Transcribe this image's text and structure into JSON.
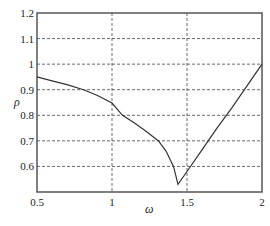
{
  "chart_data": {
    "type": "line",
    "title": "",
    "xlabel": "ω",
    "ylabel": "ρ",
    "xlim": [
      0.5,
      2
    ],
    "ylim": [
      0.5,
      1.2
    ],
    "xticks": [
      "0.5",
      "1",
      "1.5",
      "2"
    ],
    "yticks": [
      "0.6",
      "0.7",
      "0.8",
      "0.9",
      "1",
      "1.1",
      "1.2"
    ],
    "grid": true,
    "legend": null,
    "series": [
      {
        "name": "rho",
        "x": [
          0.5,
          0.6,
          0.7,
          0.81,
          0.9,
          1.0,
          1.07,
          1.15,
          1.22,
          1.31,
          1.36,
          1.41,
          1.44,
          1.5,
          1.6,
          1.7,
          1.8,
          1.9,
          2.0
        ],
        "y": [
          0.95,
          0.935,
          0.92,
          0.9,
          0.878,
          0.848,
          0.8,
          0.77,
          0.74,
          0.7,
          0.66,
          0.6,
          0.53,
          0.58,
          0.665,
          0.75,
          0.83,
          0.915,
          1.0
        ]
      }
    ]
  },
  "axes": {
    "x_label": "ω",
    "y_label": "ρ",
    "x_ticks": [
      "0.5",
      "1",
      "1.5",
      "2"
    ],
    "y_ticks": [
      "0.6",
      "0.7",
      "0.8",
      "0.9",
      "1",
      "1.1",
      "1.2"
    ]
  },
  "colors": {
    "line": "#333333",
    "grid": "#444444",
    "axis": "#555555"
  }
}
